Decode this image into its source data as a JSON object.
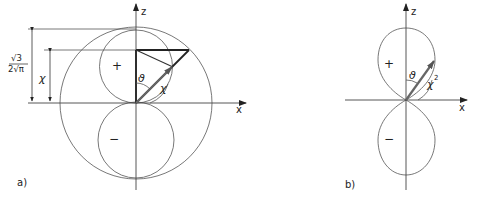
{
  "figure": {
    "panels": [
      {
        "id": "a",
        "caption": "a)",
        "axes": {
          "vertical": "z",
          "horizontal": "x"
        },
        "lobe_signs": {
          "upper": "+",
          "lower": "−"
        },
        "labels": {
          "angle": "ϑ",
          "vector": "χ",
          "dim_outer_numerator": "√3",
          "dim_outer_denominator": "2√π",
          "dim_inner": "χ"
        }
      },
      {
        "id": "b",
        "caption": "b)",
        "axes": {
          "vertical": "z",
          "horizontal": "x"
        },
        "lobe_signs": {
          "upper": "+",
          "lower": "−"
        },
        "labels": {
          "angle": "ϑ",
          "vector": "χ",
          "vector_exponent": "2"
        }
      }
    ],
    "colors": {
      "line": "#333333",
      "background": "#ffffff"
    }
  }
}
